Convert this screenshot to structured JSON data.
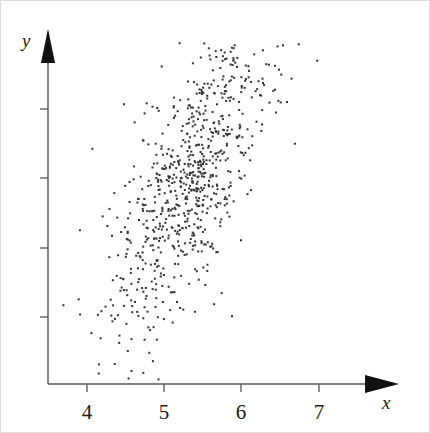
{
  "figure": {
    "kind": "scatter-plot",
    "width": 430,
    "height": 433,
    "background_color": "#ffffff",
    "axis_color": "#555555",
    "point_color": "#333333",
    "point_size_px": 2
  },
  "axes": {
    "x_axis": {
      "label": "x",
      "label_style": "italic",
      "origin_px": 47,
      "end_px": 398,
      "baseline_y_px": 383,
      "arrowhead": "solid-triangle-right",
      "ticks": [
        {
          "label": "4",
          "value": 4,
          "x_px": 86
        },
        {
          "label": "5",
          "value": 5,
          "x_px": 163
        },
        {
          "label": "6",
          "value": 6,
          "x_px": 240
        },
        {
          "label": "7",
          "value": 7,
          "x_px": 318
        }
      ],
      "px_per_unit": 77.3,
      "visible_range": [
        3.5,
        7.55
      ]
    },
    "y_axis": {
      "label": "y",
      "label_style": "italic",
      "origin_px": 383,
      "top_px": 28,
      "baseline_x_px": 47,
      "arrowhead": "solid-triangle-up",
      "ticks": [
        {
          "label": "",
          "y_px": 108
        },
        {
          "label": "",
          "y_px": 177
        },
        {
          "label": "",
          "y_px": 247
        },
        {
          "label": "",
          "y_px": 316
        }
      ],
      "tick_spacing_px": 69.5,
      "tick_labels_shown": false
    }
  },
  "chart_data": {
    "type": "scatter",
    "title": "",
    "subtitle": "",
    "xlabel": "x",
    "ylabel": "y",
    "xlim": [
      3.5,
      7.55
    ],
    "ylim": [
      0,
      5.1
    ],
    "grid": false,
    "legend": null,
    "n_points": 820,
    "marker": {
      "shape": "square-dot",
      "size_px": 2,
      "color": "#333333"
    },
    "distribution": {
      "model": "bivariate-normal",
      "mean_x": 5.36,
      "sd_x": 0.55,
      "mean_y": 2.52,
      "sd_y": 0.92,
      "correlation": 0.76
    },
    "seed": 20240517,
    "x": [],
    "y": []
  }
}
